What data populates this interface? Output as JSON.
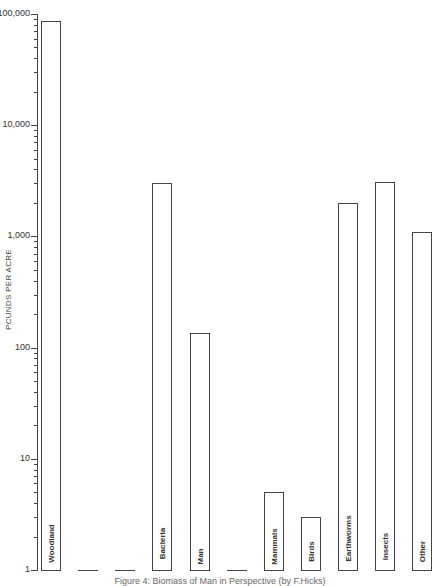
{
  "chart_data": {
    "type": "bar",
    "title": "",
    "caption": "Figure 4: Biomass of Man in Perspective (by F.Hicks)",
    "xlabel": "",
    "ylabel": "POUNDS PER ACRE",
    "yscale": "log",
    "ylim": [
      1,
      100000
    ],
    "yticks": [
      "1",
      "10",
      "100",
      "1,000",
      "10,000",
      "100,000"
    ],
    "grid": false,
    "legend": "none",
    "categories": [
      "Woodland",
      "",
      "",
      "Bacteria",
      "Man",
      "",
      "Mammals",
      "Birds",
      "Earthworms",
      "Insects",
      "Other"
    ],
    "values": [
      87000,
      1,
      1,
      3000,
      135,
      1,
      5,
      3,
      2000,
      3100,
      1100
    ]
  },
  "axis": {
    "ylabel": "PCUNDS PER ACRE",
    "ticks": [
      {
        "label": "100,000",
        "value": 100000
      },
      {
        "label": "10,000",
        "value": 10000
      },
      {
        "label": "1,000",
        "value": 1000
      },
      {
        "label": "100",
        "value": 100
      },
      {
        "label": "10",
        "value": 10
      },
      {
        "label": "1",
        "value": 1
      }
    ]
  },
  "bars": [
    {
      "label": "Woodland",
      "value": 87000,
      "kind": "bar"
    },
    {
      "label": "",
      "value": 1,
      "kind": "flat"
    },
    {
      "label": "",
      "value": 1,
      "kind": "flat"
    },
    {
      "label": "Bacteria",
      "value": 3000,
      "kind": "bar"
    },
    {
      "label": "Man",
      "value": 135,
      "kind": "bar"
    },
    {
      "label": "",
      "value": 1,
      "kind": "flat"
    },
    {
      "label": "Mammals",
      "value": 5,
      "kind": "bar"
    },
    {
      "label": "Birds",
      "value": 3,
      "kind": "bar"
    },
    {
      "label": "Earthworms",
      "value": 2000,
      "kind": "bar"
    },
    {
      "label": "Insects",
      "value": 3100,
      "kind": "bar"
    },
    {
      "label": "Other",
      "value": 1100,
      "kind": "bar"
    }
  ],
  "caption": "Figure 4: Biomass of Man in Perspective (by F.Hicks)"
}
